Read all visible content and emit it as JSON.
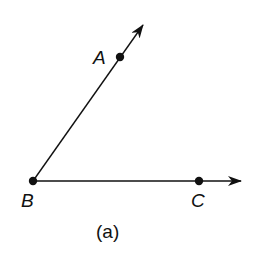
{
  "figure": {
    "caption": "(a)",
    "stroke_color": "#111111",
    "background_color": "#ffffff"
  },
  "points": [
    {
      "id": "A",
      "label": "A",
      "x": 120,
      "y": 57,
      "label_x": 93,
      "label_y": 64
    },
    {
      "id": "B",
      "label": "B",
      "x": 33,
      "y": 181,
      "label_x": 21,
      "label_y": 207
    },
    {
      "id": "C",
      "label": "C",
      "x": 199,
      "y": 181,
      "label_x": 191,
      "label_y": 207
    }
  ],
  "rays": [
    {
      "id": "ray-BA",
      "from": "B",
      "through": "A",
      "tip_x": 143,
      "tip_y": 25
    },
    {
      "id": "ray-BC",
      "from": "B",
      "through": "C",
      "tip_x": 241,
      "tip_y": 181
    }
  ],
  "vertex": "B"
}
